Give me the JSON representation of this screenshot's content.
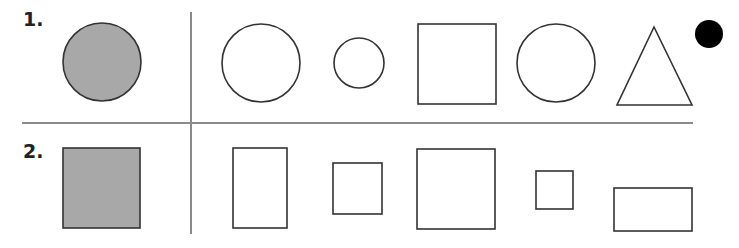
{
  "rows": [
    {
      "label": "1.",
      "reference": {
        "shape": "circle",
        "fill": "#a8a8a8",
        "cx": 102,
        "cy": 62,
        "r": 39
      },
      "options": [
        {
          "shape": "circle",
          "cx": 261,
          "cy": 63,
          "r": 39
        },
        {
          "shape": "circle",
          "cx": 359,
          "cy": 63,
          "r": 25
        },
        {
          "shape": "square",
          "x": 418,
          "y": 24,
          "w": 78,
          "h": 80
        },
        {
          "shape": "circle",
          "cx": 556,
          "cy": 63,
          "r": 39
        },
        {
          "shape": "triangle",
          "points": "654,27 617,105 692,105"
        }
      ]
    },
    {
      "label": "2.",
      "reference": {
        "shape": "square",
        "fill": "#a8a8a8",
        "x": 63,
        "y": 148,
        "w": 77,
        "h": 80
      },
      "options": [
        {
          "shape": "rect",
          "x": 233,
          "y": 148,
          "w": 54,
          "h": 80
        },
        {
          "shape": "square",
          "x": 333,
          "y": 163,
          "w": 49,
          "h": 51
        },
        {
          "shape": "square",
          "x": 417,
          "y": 149,
          "w": 78,
          "h": 80
        },
        {
          "shape": "square",
          "x": 536,
          "y": 171,
          "w": 37,
          "h": 38
        },
        {
          "shape": "rect",
          "x": 614,
          "y": 188,
          "w": 78,
          "h": 43
        }
      ]
    }
  ],
  "marker": {
    "shape": "dot",
    "fill": "#000000",
    "cx": 709,
    "cy": 34,
    "r": 14
  },
  "colors": {
    "stroke": "#333333",
    "divider": "#888888",
    "reference_fill": "#a8a8a8"
  }
}
